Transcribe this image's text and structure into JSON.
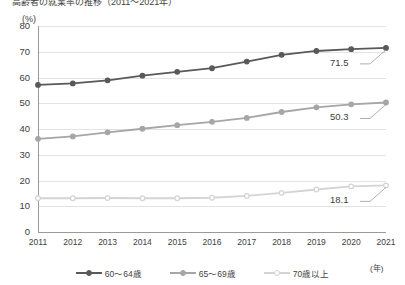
{
  "chart_data": {
    "type": "line",
    "title": "高齢者の就業率の推移（2011～2021年）",
    "xlabel": "(年)",
    "ylabel": "(%)",
    "ylim": [
      0,
      80
    ],
    "ytick_step": 10,
    "grid": true,
    "legend_position": "bottom",
    "categories": [
      "2011",
      "2012",
      "2013",
      "2014",
      "2015",
      "2016",
      "2017",
      "2018",
      "2019",
      "2020",
      "2021"
    ],
    "yticks": [
      "0",
      "10",
      "20",
      "30",
      "40",
      "50",
      "60",
      "70",
      "80"
    ],
    "series": [
      {
        "name": "60～64歳",
        "color": "#595959",
        "marker": "filled",
        "values": [
          57.1,
          57.7,
          58.9,
          60.7,
          62.2,
          63.6,
          66.2,
          68.8,
          70.3,
          71.0,
          71.5
        ],
        "end_label": "71.5"
      },
      {
        "name": "65～69歳",
        "color": "#a6a6a6",
        "marker": "filled",
        "values": [
          36.2,
          37.1,
          38.7,
          40.1,
          41.5,
          42.8,
          44.3,
          46.6,
          48.4,
          49.6,
          50.3
        ],
        "end_label": "50.3"
      },
      {
        "name": "70歳以上",
        "color": "#d4d4d4",
        "marker": "hollow",
        "values": [
          13.1,
          13.1,
          13.2,
          13.1,
          13.1,
          13.3,
          14.0,
          15.2,
          16.5,
          17.7,
          18.1
        ],
        "end_label": "18.1"
      }
    ],
    "annotations": [
      {
        "text": "71.5",
        "series": "60～64歳",
        "at": "2021"
      },
      {
        "text": "50.3",
        "series": "65～69歳",
        "at": "2021"
      },
      {
        "text": "18.1",
        "series": "70歳以上",
        "at": "2021"
      }
    ]
  }
}
